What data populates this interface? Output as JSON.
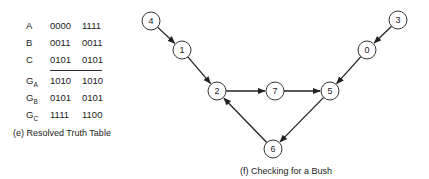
{
  "truth_table": {
    "rows": [
      {
        "label": "A",
        "sub": "",
        "v1": "0000",
        "v2": "1111"
      },
      {
        "label": "B",
        "sub": "",
        "v1": "0011",
        "v2": "0011"
      },
      {
        "label": "C",
        "sub": "",
        "v1": "0101",
        "v2": "0101"
      },
      {
        "label": "G",
        "sub": "A",
        "v1": "1010",
        "v2": "1010"
      },
      {
        "label": "G",
        "sub": "B",
        "v1": "0101",
        "v2": "0101"
      },
      {
        "label": "G",
        "sub": "C",
        "v1": "1111",
        "v2": "1100"
      }
    ],
    "caption": "(e) Resolved Truth Table"
  },
  "graph": {
    "caption": "(f) Checking for a Bush",
    "nodes": [
      {
        "id": "4",
        "x": 151,
        "y": 21
      },
      {
        "id": "1",
        "x": 182,
        "y": 50
      },
      {
        "id": "2",
        "x": 217,
        "y": 91
      },
      {
        "id": "7",
        "x": 275,
        "y": 91
      },
      {
        "id": "5",
        "x": 330,
        "y": 91
      },
      {
        "id": "0",
        "x": 367,
        "y": 50
      },
      {
        "id": "3",
        "x": 398,
        "y": 20
      },
      {
        "id": "6",
        "x": 273,
        "y": 149
      }
    ],
    "edges": [
      {
        "from": "4",
        "to": "1"
      },
      {
        "from": "1",
        "to": "2"
      },
      {
        "from": "2",
        "to": "7"
      },
      {
        "from": "7",
        "to": "5"
      },
      {
        "from": "3",
        "to": "0"
      },
      {
        "from": "0",
        "to": "5"
      },
      {
        "from": "5",
        "to": "6"
      },
      {
        "from": "6",
        "to": "2"
      }
    ]
  }
}
